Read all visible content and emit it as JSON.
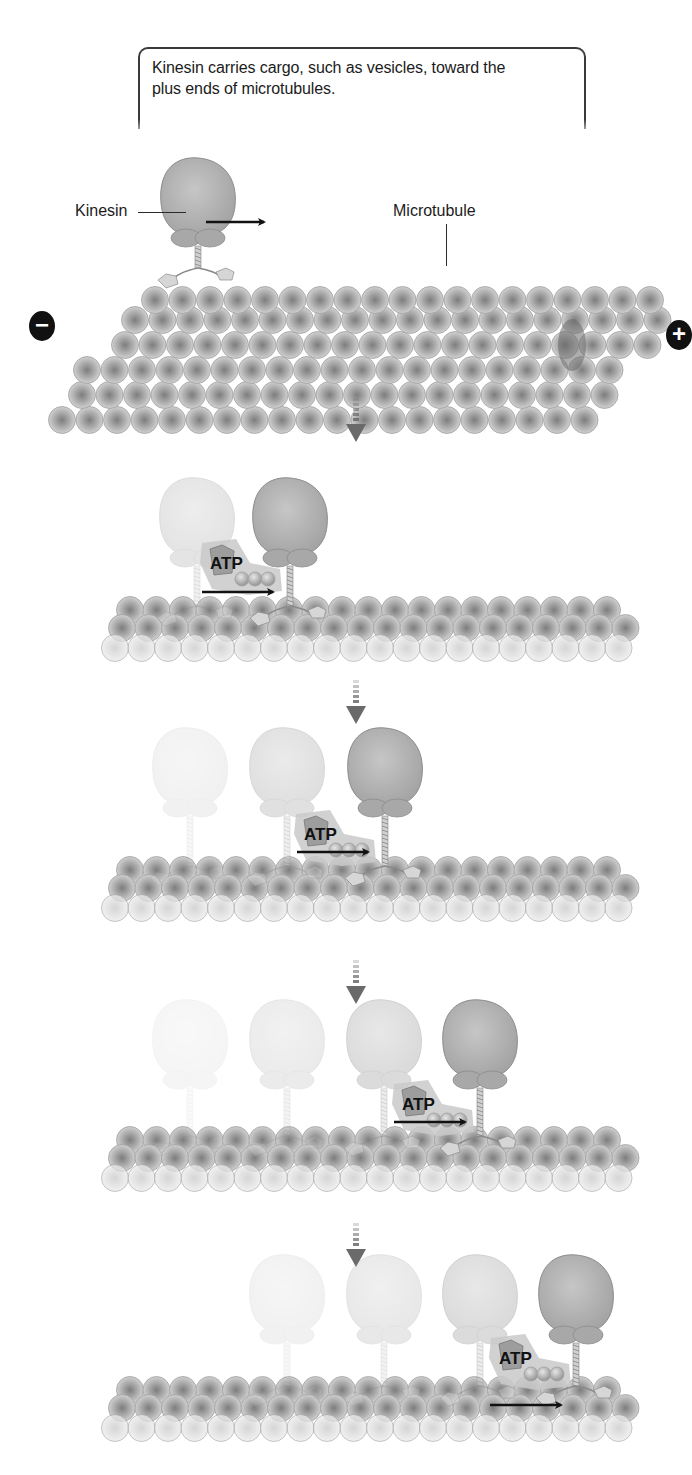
{
  "caption": {
    "line1": "Kinesin carries cargo, such as vesicles, toward the",
    "line2": "plus ends of microtubules."
  },
  "labels": {
    "kinesin": "Kinesin",
    "microtubule": "Microtubule",
    "minus_end": "−",
    "plus_end": "+",
    "atp": "ATP"
  },
  "colors": {
    "kinesin_head": "#b4b4b4",
    "kinesin_outline": "#8c8c8c",
    "tubulin_center": "#7d7d7d",
    "tubulin_edge": "#d9d9d9",
    "atp_halo": "#c9c9c9",
    "atp_shape": "#9d9d9d",
    "arrow": "#111111",
    "step_arrow": "#6a6a6a"
  },
  "overview_panel": {
    "kinesin": {
      "x": 198,
      "head_top": 158,
      "stalk_bottom": 280
    },
    "motion_arrow": {
      "x1": 206,
      "x2": 268,
      "y": 222
    },
    "microtubule_rows": [
      {
        "y": 280,
        "x_start": 155,
        "count": 19,
        "spacing": 27.5,
        "shade": 1.0
      },
      {
        "y": 300,
        "x_start": 135,
        "count": 20,
        "spacing": 27.5,
        "shade": 1.0
      },
      {
        "y": 325,
        "x_start": 125,
        "count": 20,
        "spacing": 27.5,
        "shade": 1.0
      },
      {
        "y": 350,
        "x_start": 87,
        "count": 20,
        "spacing": 27.5,
        "shade": 1.0
      },
      {
        "y": 375,
        "x_start": 82,
        "count": 20,
        "spacing": 27.5,
        "shade": 1.0
      },
      {
        "y": 400,
        "x_start": 62,
        "count": 20,
        "spacing": 27.5,
        "shade": 1.0
      }
    ]
  },
  "step_arrows": [
    {
      "x": 356,
      "y": 398
    },
    {
      "x": 356,
      "y": 680
    },
    {
      "x": 356,
      "y": 960
    },
    {
      "x": 356,
      "y": 1223
    }
  ],
  "steps": [
    {
      "top": 478,
      "track_y": 640,
      "kinesins": [
        {
          "x": 197,
          "opacity": 0.3
        },
        {
          "x": 290,
          "opacity": 1.0
        }
      ],
      "atp": {
        "x": 208,
        "y": 555
      },
      "arrow": {
        "x1": 202,
        "x2": 277,
        "y": 592
      }
    },
    {
      "top": 728,
      "track_y": 900,
      "kinesins": [
        {
          "x": 190,
          "opacity": 0.15
        },
        {
          "x": 287,
          "opacity": 0.35
        },
        {
          "x": 385,
          "opacity": 1.0
        }
      ],
      "atp": {
        "x": 302,
        "y": 826
      },
      "arrow": {
        "x1": 297,
        "x2": 372,
        "y": 852
      }
    },
    {
      "top": 1000,
      "track_y": 1170,
      "kinesins": [
        {
          "x": 190,
          "opacity": 0.1
        },
        {
          "x": 287,
          "opacity": 0.22
        },
        {
          "x": 384,
          "opacity": 0.4
        },
        {
          "x": 480,
          "opacity": 1.0
        }
      ],
      "atp": {
        "x": 400,
        "y": 1096
      },
      "arrow": {
        "x1": 394,
        "x2": 469,
        "y": 1122
      }
    },
    {
      "top": 1255,
      "track_y": 1420,
      "kinesins": [
        {
          "x": 287,
          "opacity": 0.15
        },
        {
          "x": 384,
          "opacity": 0.25
        },
        {
          "x": 480,
          "opacity": 0.4
        },
        {
          "x": 576,
          "opacity": 1.0
        }
      ],
      "atp": {
        "x": 497,
        "y": 1350
      },
      "arrow": {
        "x1": 490,
        "x2": 565,
        "y": 1405
      }
    }
  ]
}
